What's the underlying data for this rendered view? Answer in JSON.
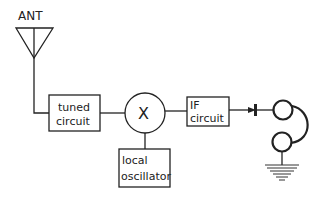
{
  "diagram": {
    "antenna": {
      "label": "ANT"
    },
    "blocks": [
      {
        "id": "tuned",
        "line1": "tuned",
        "line2": "circuit"
      },
      {
        "id": "mixer",
        "symbol": "X"
      },
      {
        "id": "local_osc",
        "line1": "local",
        "line2": "oscillator"
      },
      {
        "id": "if",
        "line1": "IF",
        "line2": "circuit"
      }
    ],
    "components": {
      "detector": "diode-icon",
      "output": "earphone-icon",
      "ground": "ground-icon"
    },
    "colors": {
      "stroke": "#222222",
      "background": "#ffffff"
    }
  }
}
